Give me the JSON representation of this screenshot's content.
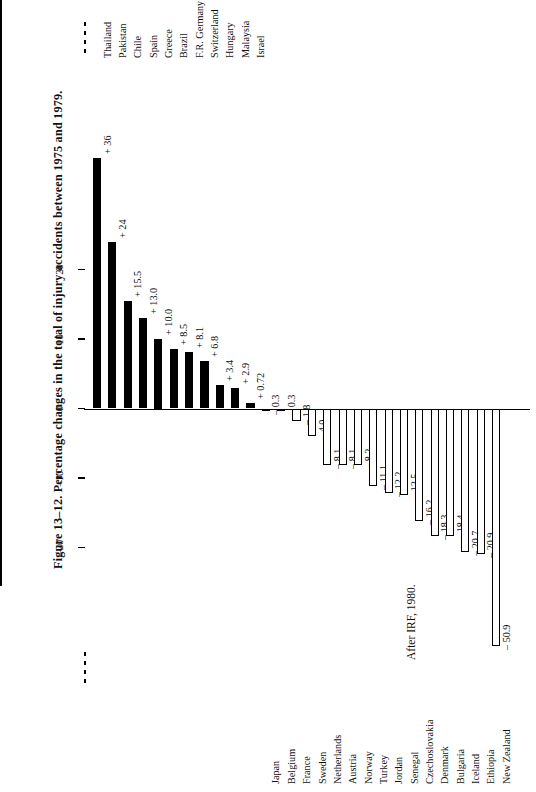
{
  "figure": {
    "caption": "Figure 13–12.  Percentage changes in the total of injury accidents between 1975 and  1979.",
    "source": "After IRF, 1980."
  },
  "axis": {
    "ticks": [
      {
        "value": 20,
        "label": "20"
      },
      {
        "value": 10,
        "label": "10"
      },
      {
        "value": 0,
        "label": "0"
      },
      {
        "value": -10,
        "label": "–10"
      },
      {
        "value": -20,
        "label": "–20"
      }
    ],
    "broken_top": true,
    "broken_bottom": true
  },
  "chart_data": {
    "type": "bar",
    "title": "Figure 13–12.  Percentage changes in the total of injury accidents between 1975 and  1979.",
    "xlabel": "",
    "ylabel": "",
    "ylim": [
      -22,
      27
    ],
    "grid": false,
    "legend": "none",
    "orientation": "vertical-bars-rotated",
    "note": "Thailand bar is axis-broken; New Zealand bar is clipped at the axis break.",
    "categories": [
      "Thailand",
      "Pakistan",
      "Chile",
      "Spain",
      "Greece",
      "Brazil",
      "F.R. Germany",
      "Switzerland",
      "Hungary",
      "Malaysia",
      "Israel",
      "Japan",
      "Belgium",
      "France",
      "Sweden",
      "Netherlands",
      "Austria",
      "Norway",
      "Turkey",
      "Jordan",
      "Senegal",
      "Czechoslovakia",
      "Denmark",
      "Bulgaria",
      "Iceland",
      "Ethiopia",
      "New Zealand"
    ],
    "values": [
      36,
      24,
      15.5,
      13.0,
      10.0,
      8.5,
      8.1,
      6.8,
      3.4,
      2.9,
      0.72,
      -0.3,
      -0.3,
      -1.8,
      -4.0,
      -8.1,
      -8.1,
      -8.2,
      -11.1,
      -12.2,
      -12.5,
      -16.2,
      -18.3,
      -18.4,
      -20.7,
      -20.9,
      -50.9
    ],
    "data_labels": [
      "+ 36",
      "+ 24",
      "+ 15.5",
      "+ 13.0",
      "+ 10.0",
      "+ 8.5",
      "+ 8.1",
      "+ 6.8",
      "+ 3.4",
      "+ 2.9",
      "+ 0.72",
      "– 0.3",
      "– 0.3",
      "– 1.8",
      "– 4.0",
      "– 8.1",
      "– 8.1",
      "– 8.2",
      "– 11.1",
      "– 12.2",
      "– 12.5",
      "– 16.2",
      "– 18.3",
      "– 18.4",
      "– 20.7",
      "– 20.9",
      "– 50.9"
    ]
  }
}
